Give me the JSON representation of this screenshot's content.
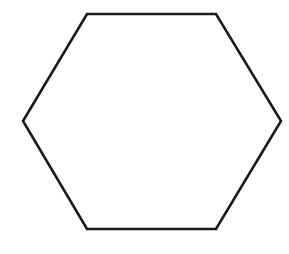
{
  "diagram": {
    "shape": "regular-hexagon",
    "orientation": "flat-top",
    "vertices": [
      [
        87,
        14
      ],
      [
        216,
        14
      ],
      [
        281,
        121
      ],
      [
        216,
        229
      ],
      [
        87,
        229
      ],
      [
        23,
        121
      ]
    ],
    "stroke_color": "#1a1a1a",
    "stroke_width": 2.6,
    "fill_color": "#ffffff",
    "background": "#ffffff"
  }
}
